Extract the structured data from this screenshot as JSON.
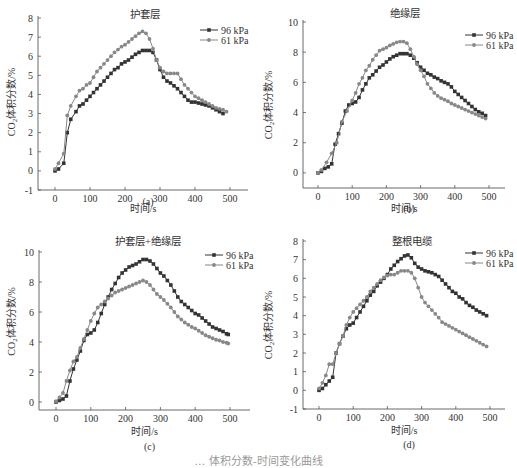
{
  "figure": {
    "caption_partial": "… 体积分数-时间变化曲线"
  },
  "chart_data": [
    {
      "panel": "(a)",
      "type": "line",
      "title": "护套层",
      "xlabel": "时间/s",
      "ylabel": "CO2体积分数/%",
      "xlim": [
        -50,
        550
      ],
      "ylim": [
        -1,
        8
      ],
      "xticks": [
        0,
        100,
        200,
        300,
        400,
        500
      ],
      "yticks": [
        -1,
        0,
        1,
        2,
        3,
        4,
        5,
        6,
        7,
        8
      ],
      "legend_position": "upper right",
      "grid": false,
      "series": [
        {
          "name": "96 kPa",
          "marker": "square",
          "color": "#333333",
          "x": [
            0,
            10,
            25,
            35,
            45,
            60,
            70,
            80,
            90,
            100,
            110,
            120,
            130,
            140,
            150,
            160,
            170,
            180,
            190,
            200,
            210,
            220,
            230,
            240,
            250,
            260,
            270,
            280,
            290,
            300,
            310,
            320,
            330,
            340,
            350,
            360,
            370,
            380,
            390,
            400,
            410,
            420,
            430,
            440,
            450,
            460,
            470,
            480
          ],
          "values": [
            0,
            0.1,
            0.4,
            2.0,
            2.7,
            3.1,
            3.4,
            3.5,
            3.7,
            3.9,
            4.1,
            4.3,
            4.5,
            4.7,
            4.9,
            5.1,
            5.3,
            5.4,
            5.6,
            5.7,
            5.8,
            5.95,
            6.1,
            6.2,
            6.3,
            6.3,
            6.3,
            6.2,
            5.8,
            5.3,
            4.9,
            4.7,
            4.6,
            4.45,
            4.3,
            4.1,
            3.9,
            3.7,
            3.6,
            3.6,
            3.55,
            3.5,
            3.45,
            3.4,
            3.3,
            3.2,
            3.1,
            3.0
          ]
        },
        {
          "name": "61 kPa",
          "marker": "circle",
          "color": "#888888",
          "x": [
            0,
            10,
            25,
            35,
            45,
            60,
            70,
            80,
            90,
            100,
            110,
            120,
            130,
            140,
            150,
            160,
            170,
            180,
            190,
            200,
            210,
            220,
            230,
            240,
            250,
            260,
            270,
            280,
            290,
            300,
            310,
            320,
            330,
            340,
            350,
            360,
            370,
            380,
            390,
            400,
            410,
            420,
            430,
            440,
            450,
            460,
            470,
            480,
            490
          ],
          "values": [
            0.1,
            0.4,
            0.9,
            2.9,
            3.4,
            3.9,
            4.2,
            4.3,
            4.5,
            4.6,
            4.9,
            5.2,
            5.4,
            5.6,
            5.8,
            6.0,
            6.2,
            6.35,
            6.5,
            6.6,
            6.75,
            6.9,
            7.05,
            7.2,
            7.3,
            7.2,
            6.9,
            6.4,
            5.8,
            5.4,
            5.2,
            5.1,
            5.1,
            5.1,
            5.1,
            4.8,
            4.5,
            4.3,
            4.1,
            3.9,
            3.8,
            3.7,
            3.6,
            3.5,
            3.4,
            3.3,
            3.25,
            3.2,
            3.1
          ]
        }
      ]
    },
    {
      "panel": "(b)",
      "type": "line",
      "title": "绝缘层",
      "xlabel": "时间/s",
      "ylabel": "CO2体积分数/%",
      "xlim": [
        -50,
        550
      ],
      "ylim": [
        -1,
        10
      ],
      "xticks": [
        0,
        100,
        200,
        300,
        400,
        500
      ],
      "yticks": [
        0,
        2,
        4,
        6,
        8,
        10
      ],
      "legend_position": "upper right",
      "grid": false,
      "series": [
        {
          "name": "96 kPa",
          "marker": "square",
          "color": "#333333",
          "x": [
            0,
            10,
            20,
            30,
            40,
            50,
            60,
            70,
            80,
            90,
            100,
            110,
            120,
            130,
            140,
            150,
            160,
            170,
            180,
            190,
            200,
            210,
            220,
            230,
            240,
            250,
            260,
            270,
            280,
            290,
            300,
            310,
            320,
            330,
            340,
            350,
            360,
            370,
            380,
            390,
            400,
            410,
            420,
            430,
            440,
            450,
            460,
            470,
            480,
            490
          ],
          "values": [
            0,
            0.1,
            0.3,
            0.4,
            0.6,
            1.9,
            2.6,
            3.3,
            4.1,
            4.5,
            4.6,
            4.7,
            5.0,
            5.5,
            5.9,
            6.3,
            6.5,
            6.75,
            7.0,
            7.15,
            7.35,
            7.55,
            7.7,
            7.8,
            7.9,
            7.9,
            7.9,
            7.8,
            7.6,
            7.3,
            7.0,
            6.8,
            6.6,
            6.5,
            6.35,
            6.25,
            6.1,
            6.0,
            5.9,
            5.7,
            5.4,
            5.2,
            5.0,
            4.8,
            4.6,
            4.4,
            4.2,
            4.05,
            3.95,
            3.8
          ]
        },
        {
          "name": "61 kPa",
          "marker": "circle",
          "color": "#888888",
          "x": [
            0,
            10,
            25,
            40,
            55,
            70,
            85,
            100,
            110,
            120,
            130,
            140,
            150,
            160,
            170,
            180,
            190,
            200,
            210,
            220,
            230,
            240,
            250,
            260,
            270,
            280,
            290,
            300,
            310,
            320,
            330,
            340,
            350,
            360,
            370,
            380,
            390,
            400,
            410,
            420,
            430,
            440,
            450,
            460,
            470,
            480,
            490
          ],
          "values": [
            0,
            0.2,
            0.7,
            1.3,
            2.0,
            3.4,
            4.1,
            4.8,
            5.3,
            5.9,
            6.3,
            6.8,
            7.1,
            7.5,
            7.8,
            8.1,
            8.2,
            8.3,
            8.45,
            8.55,
            8.65,
            8.7,
            8.7,
            8.6,
            8.2,
            7.7,
            7.2,
            6.8,
            6.4,
            5.9,
            5.6,
            5.3,
            5.1,
            4.95,
            4.85,
            4.75,
            4.6,
            4.5,
            4.4,
            4.3,
            4.2,
            4.1,
            4.0,
            3.9,
            3.8,
            3.7,
            3.6
          ]
        }
      ]
    },
    {
      "panel": "(c)",
      "type": "line",
      "title": "护套层+绝缘层",
      "xlabel": "时间/s",
      "ylabel": "CO2体积分数/%",
      "xlim": [
        -50,
        550
      ],
      "ylim": [
        -1,
        11
      ],
      "xticks": [
        0,
        100,
        200,
        300,
        400,
        500
      ],
      "yticks": [
        0,
        2,
        4,
        6,
        8,
        10
      ],
      "legend_position": "upper right",
      "grid": false,
      "series": [
        {
          "name": "96 kPa",
          "marker": "square",
          "color": "#333333",
          "x": [
            0,
            10,
            20,
            30,
            40,
            50,
            60,
            70,
            80,
            90,
            100,
            110,
            120,
            130,
            140,
            150,
            160,
            170,
            180,
            190,
            200,
            210,
            220,
            230,
            240,
            250,
            260,
            270,
            280,
            290,
            300,
            310,
            320,
            330,
            340,
            350,
            360,
            370,
            380,
            390,
            400,
            410,
            420,
            430,
            440,
            450,
            460,
            470,
            480,
            490,
            495
          ],
          "values": [
            0,
            0.1,
            0.2,
            0.4,
            1.4,
            2.2,
            2.8,
            3.4,
            4.1,
            4.5,
            4.6,
            4.8,
            5.3,
            5.9,
            6.5,
            7.0,
            7.5,
            7.9,
            8.3,
            8.6,
            8.8,
            9.0,
            9.1,
            9.2,
            9.35,
            9.5,
            9.5,
            9.4,
            9.2,
            8.9,
            8.6,
            8.4,
            8.1,
            7.8,
            7.4,
            7.0,
            6.7,
            6.5,
            6.3,
            6.1,
            5.9,
            5.8,
            5.6,
            5.4,
            5.2,
            5.0,
            4.9,
            4.8,
            4.7,
            4.55,
            4.5
          ]
        },
        {
          "name": "61 kPa",
          "marker": "circle",
          "color": "#888888",
          "x": [
            0,
            10,
            20,
            30,
            40,
            50,
            60,
            70,
            80,
            90,
            100,
            110,
            120,
            130,
            140,
            150,
            160,
            170,
            180,
            190,
            200,
            210,
            220,
            230,
            240,
            250,
            260,
            270,
            280,
            290,
            300,
            310,
            320,
            330,
            340,
            350,
            360,
            370,
            380,
            390,
            400,
            410,
            420,
            430,
            440,
            450,
            460,
            470,
            480,
            490,
            495
          ],
          "values": [
            0.05,
            0.3,
            0.6,
            1.4,
            2.1,
            2.7,
            3.0,
            3.6,
            4.2,
            4.8,
            5.4,
            5.9,
            6.3,
            6.5,
            6.7,
            6.9,
            7.1,
            7.3,
            7.4,
            7.5,
            7.6,
            7.7,
            7.8,
            7.9,
            8.0,
            8.1,
            8.0,
            7.8,
            7.5,
            7.2,
            7.0,
            6.8,
            6.55,
            6.3,
            6.0,
            5.7,
            5.5,
            5.3,
            5.15,
            5.0,
            4.9,
            4.75,
            4.6,
            4.45,
            4.35,
            4.25,
            4.15,
            4.1,
            4.0,
            3.95,
            3.9
          ]
        }
      ]
    },
    {
      "panel": "(d)",
      "type": "line",
      "title": "整根电缆",
      "xlabel": "时间/s",
      "ylabel": "CO2体积分数/%",
      "xlim": [
        -50,
        550
      ],
      "ylim": [
        -1,
        8
      ],
      "xticks": [
        0,
        100,
        200,
        300,
        400,
        500
      ],
      "yticks": [
        -1,
        0,
        1,
        2,
        3,
        4,
        5,
        6,
        7,
        8
      ],
      "legend_position": "upper right",
      "grid": false,
      "series": [
        {
          "name": "96 kPa",
          "marker": "square",
          "color": "#333333",
          "x": [
            0,
            10,
            20,
            30,
            40,
            50,
            60,
            70,
            80,
            90,
            100,
            110,
            120,
            130,
            140,
            150,
            160,
            170,
            180,
            190,
            200,
            210,
            220,
            230,
            240,
            250,
            260,
            270,
            280,
            290,
            300,
            310,
            320,
            330,
            340,
            350,
            360,
            370,
            380,
            390,
            400,
            410,
            420,
            430,
            440,
            450,
            460,
            470,
            480,
            490
          ],
          "values": [
            0,
            0.1,
            0.3,
            0.5,
            0.7,
            2.0,
            2.5,
            2.9,
            3.3,
            3.5,
            3.6,
            3.9,
            4.2,
            4.5,
            4.8,
            5.1,
            5.3,
            5.6,
            5.8,
            6.0,
            6.2,
            6.5,
            6.7,
            6.9,
            7.05,
            7.2,
            7.25,
            7.1,
            6.8,
            6.6,
            6.5,
            6.4,
            6.35,
            6.3,
            6.2,
            6.1,
            5.9,
            5.7,
            5.5,
            5.3,
            5.2,
            5.0,
            4.9,
            4.7,
            4.55,
            4.45,
            4.3,
            4.2,
            4.1,
            4.0
          ]
        },
        {
          "name": "61 kPa",
          "marker": "circle",
          "color": "#888888",
          "x": [
            0,
            10,
            20,
            30,
            40,
            50,
            60,
            70,
            80,
            90,
            100,
            110,
            120,
            130,
            140,
            150,
            160,
            170,
            180,
            190,
            200,
            210,
            220,
            230,
            240,
            250,
            260,
            270,
            280,
            290,
            300,
            310,
            320,
            330,
            340,
            350,
            360,
            370,
            380,
            390,
            400,
            410,
            420,
            430,
            440,
            450,
            460,
            470,
            480,
            490
          ],
          "values": [
            0.1,
            0.4,
            0.8,
            1.4,
            1.4,
            2.0,
            2.5,
            2.9,
            3.5,
            3.9,
            4.2,
            4.4,
            4.6,
            4.8,
            5.0,
            5.3,
            5.5,
            5.7,
            5.9,
            6.05,
            6.15,
            6.2,
            6.2,
            6.3,
            6.4,
            6.4,
            6.4,
            6.3,
            6.0,
            5.5,
            5.0,
            4.7,
            4.5,
            4.3,
            4.1,
            3.9,
            3.65,
            3.55,
            3.45,
            3.35,
            3.25,
            3.15,
            3.05,
            2.95,
            2.85,
            2.75,
            2.65,
            2.55,
            2.45,
            2.35
          ]
        }
      ]
    }
  ]
}
